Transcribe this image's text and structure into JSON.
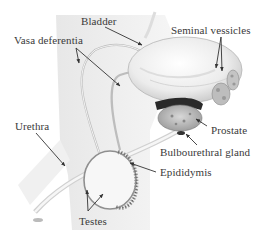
{
  "diagram": {
    "labels": [
      {
        "id": "bladder",
        "text": "Bladder"
      },
      {
        "id": "vasa-deferentia",
        "text": "Vasa deferentia"
      },
      {
        "id": "seminal-vessicles",
        "text": "Seminal vessicles"
      },
      {
        "id": "prostate",
        "text": "Prostate"
      },
      {
        "id": "urethra",
        "text": "Urethra"
      },
      {
        "id": "bulbourethral-gland",
        "text": "Bulbourethral gland"
      },
      {
        "id": "epididymis",
        "text": "Epididymis"
      },
      {
        "id": "testes",
        "text": "Testes"
      }
    ],
    "colors": {
      "body_shade": "#e6e6e6",
      "organ_light": "#f2f2f2",
      "organ_mid": "#c8c8c8",
      "organ_dark": "#2a2a2a",
      "arrow": "#333333",
      "text": "#3a3a3a"
    }
  }
}
